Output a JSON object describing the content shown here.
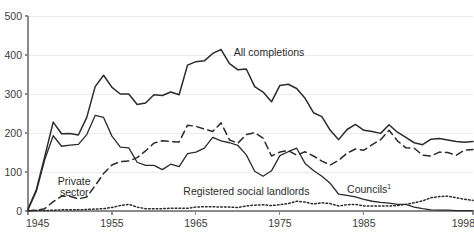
{
  "chart_data": {
    "type": "line",
    "title": "",
    "xlabel": "",
    "ylabel": "",
    "xlim": [
      1945,
      1998
    ],
    "ylim": [
      0,
      500
    ],
    "grid": true,
    "legend_position": "inline-annotations",
    "y_ticks": [
      "0",
      "100",
      "200",
      "300",
      "400",
      "500"
    ],
    "y_tick_values": [
      0,
      100,
      200,
      300,
      400,
      500
    ],
    "x_ticks": [
      "1945",
      "1955",
      "1965",
      "1975",
      "1985",
      "1998"
    ],
    "x_tick_values": [
      1945,
      1955,
      1965,
      1975,
      1985,
      1998
    ],
    "x": [
      1945,
      1946,
      1947,
      1948,
      1949,
      1950,
      1951,
      1952,
      1953,
      1954,
      1955,
      1956,
      1957,
      1958,
      1959,
      1960,
      1961,
      1962,
      1963,
      1964,
      1965,
      1966,
      1967,
      1968,
      1969,
      1970,
      1971,
      1972,
      1973,
      1974,
      1975,
      1976,
      1977,
      1978,
      1979,
      1980,
      1981,
      1982,
      1983,
      1984,
      1985,
      1986,
      1987,
      1988,
      1989,
      1990,
      1991,
      1992,
      1993,
      1994,
      1995,
      1996,
      1997,
      1998
    ],
    "series": [
      {
        "name": "All completions",
        "style": "solid",
        "label_x": 1969.5,
        "label_y": 398,
        "values": [
          5,
          55,
          140,
          228,
          198,
          199,
          195,
          240,
          319,
          348,
          317,
          300,
          300,
          273,
          277,
          298,
          296,
          305,
          298,
          374,
          383,
          385,
          404,
          414,
          378,
          362,
          364,
          319,
          305,
          280,
          322,
          325,
          314,
          289,
          252,
          242,
          207,
          183,
          209,
          222,
          207,
          204,
          199,
          221,
          202,
          189,
          175,
          170,
          184,
          186,
          182,
          178,
          176,
          178
        ]
      },
      {
        "name": "Private sector",
        "style": "dashed",
        "label_x": 1950.5,
        "label_y": 66,
        "values": [
          0,
          2,
          6,
          24,
          38,
          38,
          31,
          36,
          65,
          96,
          118,
          127,
          128,
          137,
          154,
          174,
          180,
          178,
          177,
          220,
          217,
          210,
          204,
          226,
          182,
          174,
          196,
          201,
          187,
          141,
          151,
          155,
          143,
          152,
          141,
          128,
          118,
          130,
          148,
          159,
          156,
          170,
          183,
          207,
          180,
          162,
          161,
          143,
          141,
          151,
          150,
          143,
          156,
          158
        ]
      },
      {
        "name": "Councils",
        "superscript": "1",
        "style": "solid-thin",
        "label_x": 1983.0,
        "label_y": 46,
        "values": [
          3,
          51,
          132,
          193,
          166,
          169,
          171,
          196,
          245,
          240,
          192,
          164,
          162,
          125,
          117,
          117,
          106,
          120,
          114,
          147,
          151,
          161,
          189,
          180,
          175,
          168,
          144,
          102,
          89,
          103,
          142,
          152,
          161,
          122,
          104,
          89,
          71,
          43,
          40,
          36,
          30,
          25,
          22,
          20,
          17,
          17,
          10,
          6,
          3,
          2,
          2,
          1,
          1,
          1
        ]
      },
      {
        "name": "Registered social landlords",
        "style": "dotted",
        "label_x": 1963.5,
        "label_y": 40,
        "values": [
          1,
          1,
          1,
          2,
          3,
          3,
          3,
          4,
          5,
          6,
          9,
          14,
          17,
          10,
          6,
          6,
          6,
          7,
          7,
          7,
          10,
          11,
          11,
          10,
          10,
          9,
          13,
          15,
          16,
          14,
          16,
          19,
          25,
          23,
          18,
          21,
          19,
          13,
          16,
          17,
          13,
          13,
          13,
          13,
          14,
          17,
          21,
          26,
          34,
          37,
          38,
          34,
          30,
          27
        ]
      }
    ]
  }
}
